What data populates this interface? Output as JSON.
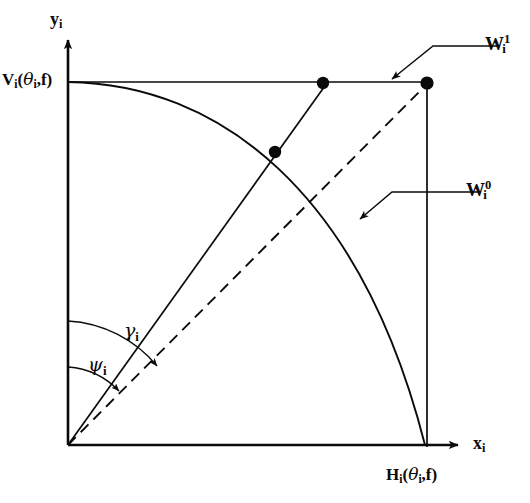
{
  "figure": {
    "axes": {
      "y_axis_label": "y",
      "y_axis_sub": "i",
      "x_axis_label": "x",
      "x_axis_sub": "i"
    },
    "labels": {
      "vertical_intercept": {
        "base": "V",
        "sub": "i",
        "args_open": "(",
        "arg_greek": "θ",
        "arg_sub": "i",
        "arg_sep": ",",
        "arg_f": "f",
        "args_close": ")",
        "full_text": "Vi(θi,f)"
      },
      "horizontal_intercept": {
        "base": "H",
        "sub": "i",
        "args_open": "(",
        "arg_greek": "θ",
        "arg_sub": "i",
        "arg_sep": ",",
        "arg_f": "f",
        "args_close": ")",
        "full_text": "Hi(θi,f)"
      },
      "w_upper": {
        "base": "W",
        "sub": "i",
        "sup": "1",
        "full_text": "Wi1"
      },
      "w_lower": {
        "base": "W",
        "sub": "i",
        "sup": "0",
        "full_text": "Wi0"
      },
      "angle_gamma": {
        "greek": "γ",
        "sub": "i",
        "full_text": "γi"
      },
      "angle_psi": {
        "greek": "ψ",
        "sub": "i",
        "full_text": "ψi"
      }
    },
    "geometry": {
      "origin": {
        "x": 68,
        "y": 445
      },
      "v_point": {
        "x": 68,
        "y": 82
      },
      "h_point": {
        "x": 427,
        "y": 445
      },
      "corner_point": {
        "x": 427,
        "y": 82
      },
      "dot_on_top_edge": {
        "x": 323,
        "y": 83
      },
      "dot_on_arc": {
        "x": 275,
        "y": 152
      },
      "dot_corner": {
        "x": 427,
        "y": 83
      },
      "gamma_arc_radius": 124,
      "psi_arc_radius": 78,
      "solid_ray_angle_deg": 50,
      "dashed_ray_angle_deg": 43
    },
    "colors": {
      "ink": "#0a0a0a",
      "background": "#ffffff"
    },
    "stroke_widths": {
      "axis": 2.6,
      "box": 1.6,
      "arc": 1.8,
      "ray": 1.6,
      "leader": 1.4,
      "angle_arc": 1.3
    },
    "dash_pattern": "11 7"
  }
}
